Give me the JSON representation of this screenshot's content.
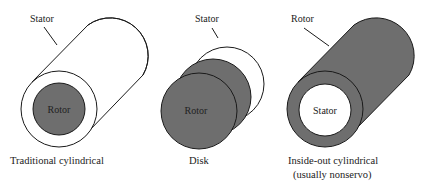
{
  "colors": {
    "stroke": "#1a1a1a",
    "gray_fill": "#6e6e6e",
    "white_fill": "#ffffff",
    "text": "#222222"
  },
  "diagrams": [
    {
      "id": "traditional",
      "caption_lines": [
        "Traditional cylindrical"
      ],
      "callout_label": "Stator",
      "inner_label": "Rotor"
    },
    {
      "id": "disk",
      "caption_lines": [
        "Disk"
      ],
      "callout_label": "Stator",
      "inner_label": "Rotor"
    },
    {
      "id": "inside-out",
      "caption_lines": [
        "Inside-out cylindrical",
        "(usually nonservo)"
      ],
      "callout_label": "Rotor",
      "inner_label": "Stator"
    }
  ]
}
